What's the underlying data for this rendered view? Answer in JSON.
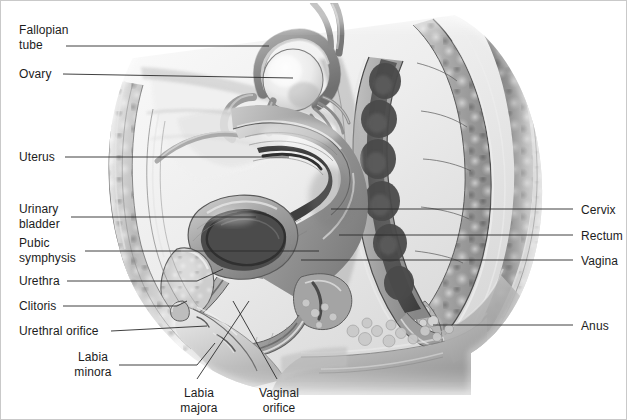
{
  "figure": {
    "width": 627,
    "height": 420,
    "background_color": "#ffffff",
    "border_color": "#c9c9c9",
    "label_color": "#1c1c1c",
    "leader_color": "#2b2b2b",
    "style": "grayscale medical illustration"
  },
  "labels": {
    "fallopian_tube": "Fallopian\ntube",
    "ovary": "Ovary",
    "uterus": "Uterus",
    "urinary_bladder": "Urinary\nbladder",
    "pubic_symphysis": "Pubic\nsymphysis",
    "urethra": "Urethra",
    "clitoris": "Clitoris",
    "urethral_orifice": "Urethral orifice",
    "labia_minora": "Labia\nminora",
    "labia_majora": "Labia\nmajora",
    "vaginal_orifice": "Vaginal\norifice",
    "cervix": "Cervix",
    "rectum": "Rectum",
    "vagina": "Vagina",
    "anus": "Anus"
  },
  "label_list": [
    {
      "key": "fallopian_tube",
      "text": "Fallopian\ntube",
      "side": "left",
      "x": 18,
      "y": 22,
      "lines": 2
    },
    {
      "key": "ovary",
      "text": "Ovary",
      "side": "left",
      "x": 18,
      "y": 66,
      "lines": 1
    },
    {
      "key": "uterus",
      "text": "Uterus",
      "side": "left",
      "x": 18,
      "y": 148,
      "lines": 1
    },
    {
      "key": "urinary_bladder",
      "text": "Urinary\nbladder",
      "side": "left",
      "x": 18,
      "y": 200,
      "lines": 2
    },
    {
      "key": "pubic_symphysis",
      "text": "Pubic\nsymphysis",
      "side": "left",
      "x": 18,
      "y": 234,
      "lines": 2
    },
    {
      "key": "urethra",
      "text": "Urethra",
      "side": "left",
      "x": 18,
      "y": 274,
      "lines": 1
    },
    {
      "key": "clitoris",
      "text": "Clitoris",
      "side": "left",
      "x": 18,
      "y": 299,
      "lines": 1
    },
    {
      "key": "urethral_orifice",
      "text": "Urethral orifice",
      "side": "left",
      "x": 18,
      "y": 324,
      "lines": 1
    },
    {
      "key": "labia_minora",
      "text": "Labia\nminora",
      "side": "left",
      "x": 68,
      "y": 350,
      "lines": 2
    },
    {
      "key": "labia_majora",
      "text": "Labia\nmajora",
      "side": "bottom",
      "x": 178,
      "y": 386,
      "lines": 2
    },
    {
      "key": "vaginal_orifice",
      "text": "Vaginal\norifice",
      "side": "bottom",
      "x": 255,
      "y": 386,
      "lines": 2
    },
    {
      "key": "cervix",
      "text": "Cervix",
      "side": "right",
      "x": 580,
      "y": 205,
      "lines": 1
    },
    {
      "key": "rectum",
      "text": "Rectum",
      "side": "right",
      "x": 580,
      "y": 230,
      "lines": 1
    },
    {
      "key": "vagina",
      "text": "Vagina",
      "side": "right",
      "x": 580,
      "y": 256,
      "lines": 1
    },
    {
      "key": "anus",
      "text": "Anus",
      "side": "right",
      "x": 580,
      "y": 320,
      "lines": 1
    }
  ],
  "structures": [
    "fallopian tube",
    "ovary",
    "uterus",
    "urinary bladder",
    "pubic symphysis",
    "urethra",
    "clitoris",
    "urethral orifice",
    "labia minora",
    "labia majora",
    "vaginal orifice",
    "cervix",
    "rectum",
    "vagina",
    "anus"
  ]
}
